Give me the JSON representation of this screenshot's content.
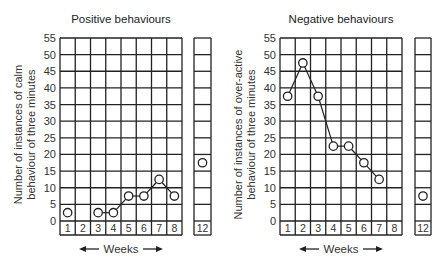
{
  "chart_data": [
    {
      "type": "line",
      "title": "Positive  behaviours",
      "ylabel_line1": "Number of instances of calm",
      "ylabel_line2": "behaviour of three minutes",
      "xlabel": "Weeks",
      "y_ticks": [
        "0",
        "5",
        "10",
        "15",
        "20",
        "25",
        "30",
        "35",
        "40",
        "45",
        "50",
        "55"
      ],
      "ylim": [
        0,
        55
      ],
      "categories": [
        "1",
        "2",
        "3",
        "4",
        "5",
        "6",
        "7",
        "8"
      ],
      "extra_category": "12",
      "series": [
        {
          "name": "calm behaviour",
          "x": [
            1,
            3,
            4,
            5,
            6,
            7,
            8
          ],
          "values": [
            2.5,
            2.5,
            2.5,
            7.5,
            7.5,
            12.5,
            7.5
          ],
          "connected_from_index": 1
        }
      ],
      "extra_point": {
        "x": 12,
        "value": 17.5
      },
      "grid": true
    },
    {
      "type": "line",
      "title": "Negative  behaviours",
      "ylabel_line1": "Number of instances of over-active",
      "ylabel_line2": "behaviour of three minutes",
      "xlabel": "Weeks",
      "y_ticks": [
        "0",
        "5",
        "10",
        "15",
        "20",
        "25",
        "30",
        "35",
        "40",
        "45",
        "50",
        "55"
      ],
      "ylim": [
        0,
        55
      ],
      "categories": [
        "1",
        "2",
        "3",
        "4",
        "5",
        "6",
        "7",
        "8"
      ],
      "extra_category": "12",
      "series": [
        {
          "name": "over-active behaviour",
          "x": [
            1,
            2,
            3,
            4,
            5,
            6,
            7
          ],
          "values": [
            37.5,
            47.5,
            37.5,
            22.5,
            22.5,
            17.5,
            12.5
          ],
          "connected_from_index": 0
        }
      ],
      "extra_point": {
        "x": 12,
        "value": 7.5
      },
      "grid": true
    }
  ]
}
